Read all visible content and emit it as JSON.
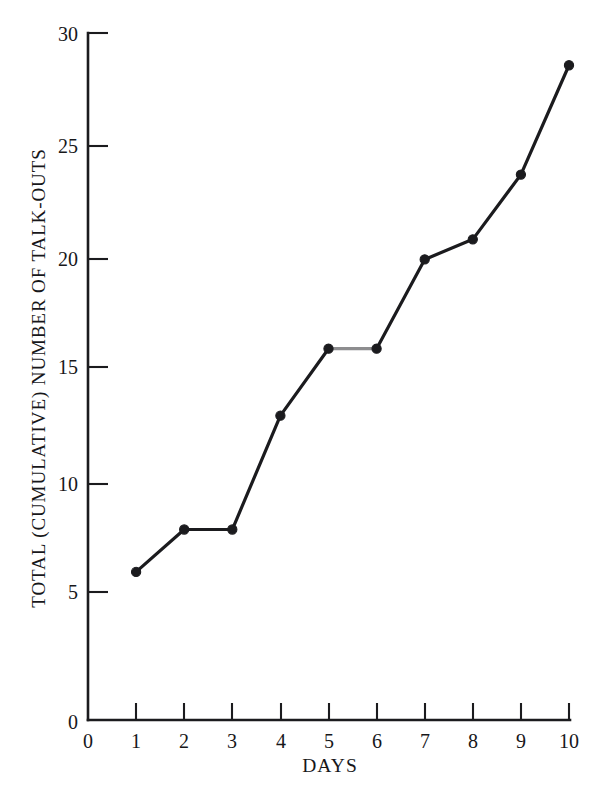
{
  "chart_data": {
    "type": "line",
    "title": "",
    "xlabel": "DAYS",
    "ylabel": "TOTAL (CUMULATIVE) NUMBER OF TALK-OUTS",
    "x": [
      1,
      2,
      3,
      4,
      5,
      6,
      7,
      8,
      9,
      10
    ],
    "values": [
      5.9,
      7.8,
      7.8,
      12.9,
      15.9,
      15.9,
      19.9,
      20.8,
      23.7,
      28.6
    ],
    "series": [
      {
        "name": "Cumulative talk-outs",
        "values": [
          5.9,
          7.8,
          7.8,
          12.9,
          15.9,
          15.9,
          19.9,
          20.8,
          23.7,
          28.6
        ]
      }
    ],
    "xlim": [
      0,
      10
    ],
    "ylim": [
      0,
      30
    ],
    "x_ticks": [
      "0",
      "1",
      "2",
      "3",
      "4",
      "5",
      "6",
      "7",
      "8",
      "9",
      "10"
    ],
    "y_ticks": [
      "0",
      "5",
      "10",
      "15",
      "20",
      "25",
      "30"
    ],
    "grid": false,
    "legend": false,
    "legend_position": "none",
    "line_color": "#1b1b1e",
    "segment_color_5_to_6": "#8d8d8f",
    "marker_color": "#1b1b1e",
    "marker_shape": "circle",
    "annotations": []
  },
  "axes": {
    "x_axis_name": "DAYS",
    "y_axis_name": "TOTAL (CUMULATIVE) NUMBER OF TALK-OUTS"
  },
  "x_tick_labels": [
    {
      "text": "0",
      "x": 88
    },
    {
      "text": "1",
      "x": 136
    },
    {
      "text": "2",
      "x": 184
    },
    {
      "text": "3",
      "x": 232
    },
    {
      "text": "4",
      "x": 281
    },
    {
      "text": "5",
      "x": 329
    },
    {
      "text": "6",
      "x": 377
    },
    {
      "text": "7",
      "x": 425
    },
    {
      "text": "8",
      "x": 473
    },
    {
      "text": "9",
      "x": 521
    },
    {
      "text": "10",
      "x": 569
    }
  ],
  "y_tick_labels": [
    {
      "text": "0",
      "y": 722
    },
    {
      "text": "5",
      "y": 592
    },
    {
      "text": "10",
      "y": 484
    },
    {
      "text": "15",
      "y": 367
    },
    {
      "text": "20",
      "y": 259
    },
    {
      "text": "25",
      "y": 146
    },
    {
      "text": "30",
      "y": 34
    }
  ],
  "colors": {
    "ink": "#1b1b1e",
    "paper": "#ffffff",
    "muted_segment": "#8d8d8f"
  }
}
